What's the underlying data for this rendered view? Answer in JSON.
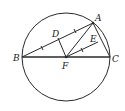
{
  "figure": {
    "type": "geometry",
    "circle": {
      "cx": 66,
      "cy": 57,
      "r": 44
    },
    "points": {
      "A": {
        "label": "A",
        "x": 93,
        "y": 23
      },
      "B": {
        "label": "B",
        "x": 22,
        "y": 57
      },
      "C": {
        "label": "C",
        "x": 110,
        "y": 57
      },
      "D": {
        "label": "D",
        "x": 58,
        "y": 38
      },
      "E": {
        "label": "E",
        "x": 98,
        "y": 42
      },
      "F": {
        "label": "F",
        "x": 66,
        "y": 57
      }
    },
    "segments": [
      [
        "B",
        "A"
      ],
      [
        "A",
        "C"
      ],
      [
        "B",
        "C"
      ],
      [
        "F",
        "D"
      ],
      [
        "F",
        "A"
      ],
      [
        "F",
        "E"
      ]
    ]
  }
}
